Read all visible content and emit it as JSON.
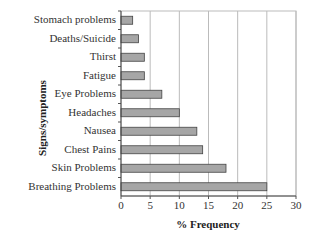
{
  "chart_data": {
    "type": "bar",
    "orientation": "horizontal",
    "title": "",
    "xlabel": "% Frequency",
    "ylabel": "Signs/symptoms",
    "categories": [
      "Stomach problems",
      "Deaths/Suicide",
      "Thirst",
      "Fatigue",
      "Eye Problems",
      "Headaches",
      "Nausea",
      "Chest Pains",
      "Skin Problems",
      "Breathing Problems"
    ],
    "values": [
      2,
      3,
      4,
      4,
      7,
      10,
      13,
      14,
      18,
      25
    ],
    "xlim": [
      0,
      30
    ],
    "xticks": [
      0,
      5,
      10,
      15,
      20,
      25,
      30
    ],
    "grid": true,
    "legend": null,
    "bar_color": "#a6a6a6",
    "bar_edge_color": "#444444",
    "grid_color": "#bbbbbb"
  }
}
